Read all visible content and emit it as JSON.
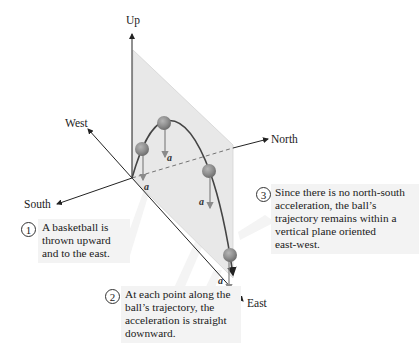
{
  "axes": {
    "up": "Up",
    "west": "West",
    "north": "North",
    "south": "South",
    "east": "East"
  },
  "vector_label": "a⃗",
  "callouts": [
    {
      "number": "1",
      "lines": [
        "A basketball is",
        "thrown upward",
        "and to the east."
      ]
    },
    {
      "number": "2",
      "lines": [
        "At each point along the",
        "ball’s trajectory, the",
        "acceleration is straight",
        "downward."
      ]
    },
    {
      "number": "3",
      "lines": [
        "Since there is no north-south",
        "acceleration, the ball’s",
        "trajectory remains within a",
        "vertical plane oriented",
        "east-west."
      ]
    }
  ],
  "colors": {
    "plane": "#e9e9e9",
    "ball": "#8c8c8c",
    "accel_arrow": "#8a8a8a",
    "axis": "#222222",
    "callout_bg": "#f3f3f3"
  }
}
